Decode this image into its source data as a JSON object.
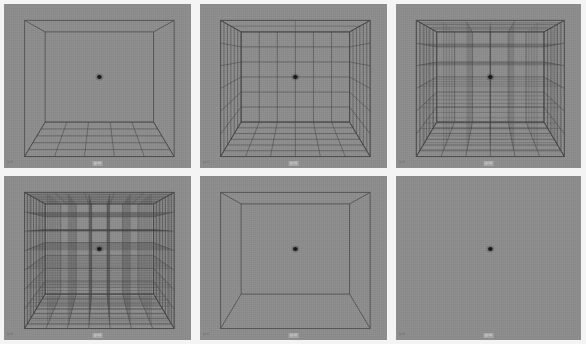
{
  "page": {
    "layout": "2 rows x 3 columns of 3D wireframe viewport panels",
    "background_color": "#f4f4f4",
    "viewport_background_color": "#8d8d8d",
    "wireframe_color": "#4a4a4a",
    "marker_color": "#1a1a1a"
  },
  "panels": [
    {
      "index": 1,
      "position": "top-left",
      "corner_label": "grid",
      "bottom_label": "grid",
      "description": "Box outline with floor grid only",
      "grid_mode": "floor-only",
      "floor_divisions": 5,
      "wall_divisions": 0,
      "volume_divisions": 0,
      "has_center_marker": true
    },
    {
      "index": 2,
      "position": "top-center",
      "corner_label": "grid",
      "bottom_label": "grid",
      "description": "Box with grids on floor, back wall, left wall and right wall",
      "grid_mode": "surfaces",
      "floor_divisions": 6,
      "wall_divisions": 6,
      "volume_divisions": 0,
      "has_center_marker": true
    },
    {
      "index": 3,
      "position": "top-right",
      "corner_label": "grid",
      "bottom_label": "grid",
      "description": "Box with surface grids plus interior depth lines",
      "grid_mode": "volumetric",
      "floor_divisions": 6,
      "wall_divisions": 6,
      "volume_divisions": 5,
      "has_center_marker": true
    },
    {
      "index": 4,
      "position": "bottom-left",
      "corner_label": "grid",
      "bottom_label": "grid",
      "description": "Dense full volumetric wireframe lattice",
      "grid_mode": "dense-volumetric",
      "floor_divisions": 7,
      "wall_divisions": 7,
      "volume_divisions": 7,
      "has_center_marker": true
    },
    {
      "index": 5,
      "position": "bottom-center",
      "corner_label": "grid",
      "bottom_label": "grid",
      "description": "Plain box outline, no grid lines",
      "grid_mode": "outline-only",
      "floor_divisions": 0,
      "wall_divisions": 0,
      "volume_divisions": 0,
      "has_center_marker": true
    },
    {
      "index": 6,
      "position": "bottom-right",
      "corner_label": "grid",
      "bottom_label": "grid",
      "description": "Empty viewport with only the center marker",
      "grid_mode": "none",
      "floor_divisions": 0,
      "wall_divisions": 0,
      "volume_divisions": 0,
      "has_center_marker": true
    }
  ]
}
